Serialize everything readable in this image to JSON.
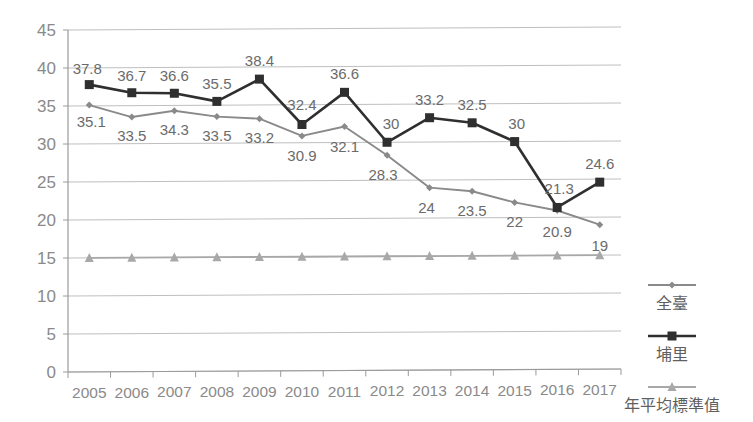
{
  "chart_data": {
    "type": "line",
    "title": "",
    "subtitle": "",
    "xlabel": "",
    "ylabel": "",
    "categories": [
      "2005",
      "2006",
      "2007",
      "2008",
      "2009",
      "2010",
      "2011",
      "2012",
      "2013",
      "2014",
      "2015",
      "2016",
      "2017"
    ],
    "ylim": [
      0,
      45
    ],
    "ytick_step": 5,
    "yticks": [
      "0",
      "5",
      "10",
      "15",
      "20",
      "25",
      "30",
      "35",
      "40",
      "45"
    ],
    "grid": true,
    "legend_position": "right",
    "series": [
      {
        "name": "全臺",
        "marker": "diamond",
        "color": "#8a8a8a",
        "values": [
          35.1,
          33.5,
          34.3,
          33.5,
          33.2,
          30.9,
          32.1,
          28.3,
          24,
          23.5,
          22,
          20.9,
          19
        ],
        "labels": [
          "35.1",
          "33.5",
          "34.3",
          "33.5",
          "33.2",
          "30.9",
          "32.1",
          "28.3",
          "24",
          "23.5",
          "22",
          "20.9",
          "19"
        ]
      },
      {
        "name": "埔里",
        "marker": "square",
        "color": "#2f2f2f",
        "values": [
          37.8,
          36.7,
          36.6,
          35.5,
          38.4,
          32.4,
          36.6,
          30,
          33.2,
          32.5,
          30,
          21.3,
          24.6
        ],
        "labels": [
          "37.8",
          "36.7",
          "36.6",
          "35.5",
          "38.4",
          "32.4",
          "36.6",
          "30",
          "33.2",
          "32.5",
          "30",
          "21.3",
          "24.6"
        ]
      },
      {
        "name": "年平均標準值",
        "marker": "triangle",
        "color": "#a8a8a8",
        "values": [
          15,
          15,
          15,
          15,
          15,
          15,
          15,
          15,
          15,
          15,
          15,
          15,
          15
        ],
        "labels": [
          "",
          "",
          "",
          "",
          "",
          "",
          "",
          "",
          "",
          "",
          "",
          "",
          ""
        ]
      }
    ]
  },
  "legend": {
    "items": [
      {
        "label": "全臺",
        "marker": "diamond",
        "color": "#8a8a8a"
      },
      {
        "label": "埔里",
        "marker": "square",
        "color": "#2f2f2f"
      },
      {
        "label": "年平均標準值",
        "marker": "triangle",
        "color": "#a8a8a8"
      }
    ]
  },
  "label_offsets": {
    "quantai": [
      {
        "dx": 2,
        "dy": 22
      },
      {
        "dx": 0,
        "dy": 24
      },
      {
        "dx": 0,
        "dy": 24
      },
      {
        "dx": 0,
        "dy": 24
      },
      {
        "dx": 0,
        "dy": 24
      },
      {
        "dx": 0,
        "dy": 25
      },
      {
        "dx": 0,
        "dy": 25
      },
      {
        "dx": -4,
        "dy": 25
      },
      {
        "dx": -3,
        "dy": 25
      },
      {
        "dx": 0,
        "dy": 25
      },
      {
        "dx": 0,
        "dy": 25
      },
      {
        "dx": 0,
        "dy": 26
      },
      {
        "dx": 0,
        "dy": 26
      }
    ],
    "puli": [
      {
        "dx": -2,
        "dy": -11
      },
      {
        "dx": 0,
        "dy": -12
      },
      {
        "dx": 0,
        "dy": -12
      },
      {
        "dx": 0,
        "dy": -12
      },
      {
        "dx": 0,
        "dy": -13
      },
      {
        "dx": 0,
        "dy": -14
      },
      {
        "dx": 0,
        "dy": -13
      },
      {
        "dx": 4,
        "dy": -13
      },
      {
        "dx": 0,
        "dy": -13
      },
      {
        "dx": 0,
        "dy": -13
      },
      {
        "dx": 2,
        "dy": -13
      },
      {
        "dx": 2,
        "dy": -13
      },
      {
        "dx": 0,
        "dy": -13
      }
    ]
  }
}
